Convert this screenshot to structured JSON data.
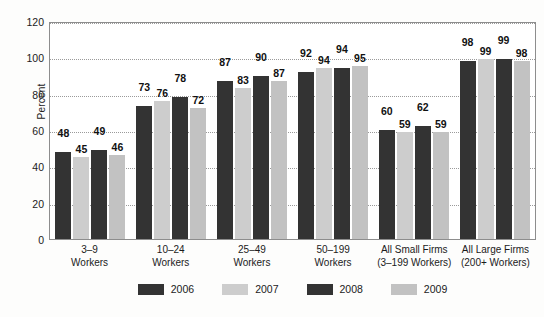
{
  "chart_data": {
    "type": "bar",
    "title": "",
    "subtitle": "",
    "xlabel": "",
    "ylabel": "Percent",
    "ylim": [
      0,
      120
    ],
    "yticks": [
      0,
      20,
      40,
      60,
      80,
      100,
      120
    ],
    "grid": true,
    "legend_position": "bottom",
    "categories": [
      [
        "3–9",
        "Workers"
      ],
      [
        "10–24",
        "Workers"
      ],
      [
        "25–49",
        "Workers"
      ],
      [
        "50–199",
        "Workers"
      ],
      [
        "All Small Firms",
        "(3–199 Workers)"
      ],
      [
        "All Large Firms",
        "(200+ Workers)"
      ]
    ],
    "category_labels_flat": [
      "3–9 Workers",
      "10–24 Workers",
      "25–49 Workers",
      "50–199 Workers",
      "All Small Firms (3–199 Workers)",
      "All Large Firms (200+ Workers)"
    ],
    "series": [
      {
        "name": "2006",
        "color": "#333333",
        "values": [
          48,
          73,
          87,
          92,
          60,
          98
        ]
      },
      {
        "name": "2007",
        "color": "#cdcdcd",
        "values": [
          45,
          76,
          83,
          94,
          59,
          99
        ]
      },
      {
        "name": "2008",
        "color": "#333333",
        "values": [
          49,
          78,
          90,
          94,
          62,
          99
        ]
      },
      {
        "name": "2009",
        "color": "#c2c2c2",
        "values": [
          46,
          72,
          87,
          95,
          59,
          98
        ]
      }
    ]
  },
  "legend": {
    "items": [
      {
        "label": "2006",
        "color": "#333333"
      },
      {
        "label": "2007",
        "color": "#cdcdcd"
      },
      {
        "label": "2008",
        "color": "#333333"
      },
      {
        "label": "2009",
        "color": "#c2c2c2"
      }
    ]
  },
  "colors": {
    "dark_bar": "#333333",
    "light_bar_2007": "#cdcdcd",
    "light_bar_2009": "#c2c2c2",
    "frame": "#8d8d8d",
    "gridline": "#9a9a9a",
    "text": "#1b1b1b",
    "background": "#fdfdfc"
  }
}
